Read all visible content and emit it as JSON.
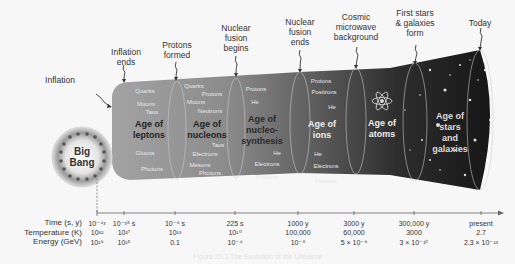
{
  "diagram": {
    "big_bang": {
      "line1": "Big",
      "line2": "Bang"
    },
    "events": [
      {
        "label": "Inflation",
        "x": 60,
        "y": 75
      },
      {
        "label": "Inflation\nends",
        "x": 126,
        "y": 47
      },
      {
        "label": "Protons\nformed",
        "x": 177,
        "y": 40
      },
      {
        "label": "Nuclear\nfusion\nbegins",
        "x": 236,
        "y": 23
      },
      {
        "label": "Nuclear\nfusion\nends",
        "x": 300,
        "y": 17
      },
      {
        "label": "Cosmic\nmicrowave\nbackground",
        "x": 356,
        "y": 12
      },
      {
        "label": "First stars\n& galaxies\nform",
        "x": 415,
        "y": 8
      },
      {
        "label": "Today",
        "x": 480,
        "y": 18
      }
    ],
    "ages": [
      {
        "label": "Age of\nleptons",
        "x": 149,
        "y": 119,
        "color": "#222222"
      },
      {
        "label": "Age of\nnucleons",
        "x": 207,
        "y": 119,
        "color": "#222222"
      },
      {
        "label": "Age of\nnucleo-\nsynthesis",
        "x": 262,
        "y": 114,
        "color": "#2a2a2a"
      },
      {
        "label": "Age of\nions",
        "x": 322,
        "y": 119,
        "color": "#eeeeee"
      },
      {
        "label": "Age of\natoms",
        "x": 382,
        "y": 118,
        "color": "#eeeeee"
      },
      {
        "label": "Age of\nstars\nand\ngalaxies",
        "x": 450,
        "y": 111,
        "color": "#dddddd"
      }
    ],
    "particles": [
      {
        "label": "Quarks",
        "x": 145,
        "y": 88
      },
      {
        "label": "Muons",
        "x": 146,
        "y": 101
      },
      {
        "label": "Taus",
        "x": 152,
        "y": 109
      },
      {
        "label": "Gluons",
        "x": 145,
        "y": 150
      },
      {
        "label": "Photons",
        "x": 152,
        "y": 166
      },
      {
        "label": "Quarks",
        "x": 194,
        "y": 83
      },
      {
        "label": "Protons",
        "x": 212,
        "y": 91
      },
      {
        "label": "Muons",
        "x": 196,
        "y": 99
      },
      {
        "label": "Neutrons",
        "x": 210,
        "y": 108
      },
      {
        "label": "Taus",
        "x": 218,
        "y": 142
      },
      {
        "label": "Electrons",
        "x": 205,
        "y": 151
      },
      {
        "label": "Mesons",
        "x": 200,
        "y": 162
      },
      {
        "label": "Photons",
        "x": 210,
        "y": 170
      },
      {
        "label": "Protons",
        "x": 256,
        "y": 86
      },
      {
        "label": "He",
        "x": 255,
        "y": 99
      },
      {
        "label": "He",
        "x": 277,
        "y": 150
      },
      {
        "label": "Electrons",
        "x": 267,
        "y": 161
      },
      {
        "label": "Photons",
        "x": 267,
        "y": 174
      },
      {
        "label": "Protons",
        "x": 321,
        "y": 78
      },
      {
        "label": "Positrons",
        "x": 324,
        "y": 89
      },
      {
        "label": "He",
        "x": 332,
        "y": 104
      },
      {
        "label": "He",
        "x": 318,
        "y": 151
      },
      {
        "label": "Electrons",
        "x": 326,
        "y": 163
      },
      {
        "label": "Photons",
        "x": 326,
        "y": 178
      }
    ],
    "timeline": {
      "row_labels": [
        "Time (s, y)",
        "Temperature (K)",
        "Energy (GeV)"
      ],
      "columns": [
        {
          "x": 97,
          "time": "10⁻⁴³",
          "temp": "10³²",
          "energy": "10¹⁹"
        },
        {
          "x": 124,
          "time": "10⁻³⁵ s",
          "temp": "10²⁷",
          "energy": "10¹⁵"
        },
        {
          "x": 175,
          "time": "10⁻⁶ s",
          "temp": "10¹³",
          "energy": "0.1"
        },
        {
          "x": 235,
          "time": "225 s",
          "temp": "10¹⁰",
          "energy": "10⁻⁴"
        },
        {
          "x": 298,
          "time": "1000 y",
          "temp": "100,000",
          "energy": "10⁻⁸"
        },
        {
          "x": 354,
          "time": "3000 y",
          "temp": "60,000",
          "energy": "5 × 10⁻⁹"
        },
        {
          "x": 414,
          "time": "300,000 y",
          "temp": "3000",
          "energy": "3 × 10⁻¹⁰"
        },
        {
          "x": 481,
          "time": "present",
          "temp": "2.7",
          "energy": "2.3 × 10⁻¹³"
        }
      ]
    },
    "caption": "Figure 29.1 The Evolution of the Universe"
  },
  "colors": {
    "background": "#f7f7f7",
    "funnel_light": "#9a9a9a",
    "funnel_dark": "#1c1c1c",
    "text": "#333333"
  }
}
